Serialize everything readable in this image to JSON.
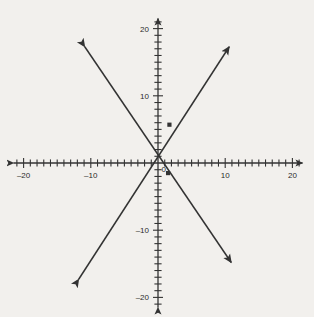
{
  "figure": {
    "title": "",
    "background_color": "#f2f0ed",
    "ink_color": "#333333",
    "label_color": "#2b2b2b",
    "width": 314,
    "height": 317
  },
  "chart_data": {
    "type": "line",
    "title": "",
    "xlabel": "",
    "ylabel": "",
    "xlim": [
      -21.5,
      21.5
    ],
    "ylim": [
      -21.5,
      21.5
    ],
    "grid": false,
    "legend": "none",
    "axes": {
      "x_axis": {
        "arrowheads": [
          "left",
          "right"
        ],
        "tick_step": 1,
        "tick_labels": [
          {
            "value": -20,
            "text": "–20"
          },
          {
            "value": -10,
            "text": "–10"
          },
          {
            "value": 10,
            "text": "10"
          },
          {
            "value": 20,
            "text": "20"
          }
        ]
      },
      "y_axis": {
        "arrowheads": [
          "up",
          "down"
        ],
        "tick_step": 1,
        "tick_labels": [
          {
            "value": 20,
            "text": "20"
          },
          {
            "value": 10,
            "text": "10"
          },
          {
            "value": -10,
            "text": "–10"
          },
          {
            "value": -20,
            "text": "–20"
          }
        ]
      },
      "origin_label": "0"
    },
    "series": [
      {
        "name": "line-positive-slope",
        "slope": 1.53,
        "intercept": 0,
        "arrowheads": [
          "start",
          "end"
        ],
        "endpoints": [
          {
            "x": -11.8,
            "y": -17.3
          },
          {
            "x": 10.6,
            "y": 17.3
          }
        ]
      },
      {
        "name": "line-negative-slope",
        "slope": -1.53,
        "intercept": 0,
        "arrowheads": [
          "start",
          "end"
        ],
        "endpoints": [
          {
            "x": -10.9,
            "y": 17.3
          },
          {
            "x": 10.9,
            "y": -14.8
          }
        ]
      }
    ],
    "points": [
      {
        "name": "marker-on-positive-line",
        "x": 1.7,
        "y": 5.7,
        "marker": "square"
      },
      {
        "name": "marker-on-negative-line",
        "x": 1.5,
        "y": -1.5,
        "marker": "square"
      }
    ]
  }
}
